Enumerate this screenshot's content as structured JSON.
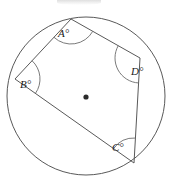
{
  "figure": {
    "background_color": "#ffffff",
    "stroke_color": "#595959",
    "label_color": "#1a1a1a",
    "circle": {
      "center_x": 86,
      "center_y": 96,
      "radius": 79
    },
    "center_point": {
      "x": 86,
      "y": 97,
      "label": ""
    },
    "vertices": [
      {
        "id": "A",
        "x": 71,
        "y": 19
      },
      {
        "id": "B",
        "x": 15,
        "y": 79
      },
      {
        "id": "C",
        "x": 134,
        "y": 163
      },
      {
        "id": "D",
        "x": 140,
        "y": 58
      }
    ],
    "angles": [
      {
        "id": "A",
        "label": "A°",
        "label_x": 58,
        "label_y": 28
      },
      {
        "id": "B",
        "label": "B°",
        "label_x": 20,
        "label_y": 79
      },
      {
        "id": "C",
        "label": "C°",
        "label_x": 112,
        "label_y": 142
      },
      {
        "id": "D",
        "label": "D°",
        "label_x": 131,
        "label_y": 66
      }
    ],
    "edges": [
      {
        "from": "A",
        "to": "B"
      },
      {
        "from": "B",
        "to": "C"
      },
      {
        "from": "C",
        "to": "D"
      },
      {
        "from": "D",
        "to": "A"
      }
    ]
  }
}
